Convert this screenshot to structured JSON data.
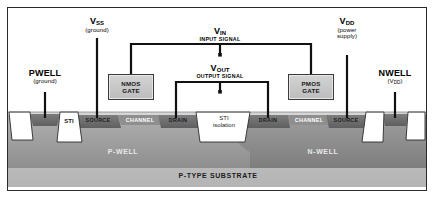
{
  "diagram": {
    "colors": {
      "border": "#2b2b2b",
      "wire": "#111111",
      "gate_fill": "#c8c8c8",
      "sti_fill": "#ffffff",
      "pwell_fill": "#9a9a9a",
      "nwell_fill": "#878787",
      "substrate_fill": "#bfbfbf",
      "diffusion_fill": "#6f6f6f",
      "oxide_fill": "#cfcfcf"
    },
    "top_labels": [
      {
        "id": "pwell-tap",
        "name": "PWELL",
        "sub": "",
        "note": "(ground)"
      },
      {
        "id": "vss",
        "name": "V",
        "sub": "SS",
        "note": "(ground)"
      },
      {
        "id": "vin",
        "name": "V",
        "sub": "IN",
        "note": "INPUT SIGNAL"
      },
      {
        "id": "vout",
        "name": "V",
        "sub": "OUT",
        "note": "OUTPUT SIGNAL"
      },
      {
        "id": "vdd",
        "name": "V",
        "sub": "DD",
        "note": "(power supply)"
      },
      {
        "id": "nwell-tap",
        "name": "NWELL",
        "sub": "",
        "note": "(V"
      }
    ],
    "pwell_label": {
      "name": "PWELL",
      "note": "(ground)"
    },
    "vss_label": {
      "name": "V",
      "sub": "SS",
      "note": "(ground)"
    },
    "vin_label": {
      "name": "V",
      "sub": "IN",
      "note": "INPUT SIGNAL"
    },
    "vout_label": {
      "name": "V",
      "sub": "OUT",
      "note": "OUTPUT SIGNAL"
    },
    "vdd_label": {
      "name": "V",
      "sub": "DD",
      "note_line1": "(power",
      "note_line2": "supply)"
    },
    "nwell_label": {
      "name": "NWELL",
      "note_pre": "(V",
      "note_sub": "DD",
      "note_post": ")"
    },
    "gates": [
      {
        "id": "nmos-gate",
        "line1": "NMOS",
        "line2": "GATE"
      },
      {
        "id": "pmos-gate",
        "line1": "PMOS",
        "line2": "GATE"
      }
    ],
    "sti_left_label": "STI",
    "sti_center_label_line1": "STI",
    "sti_center_label_line2": "isolation",
    "diffusions": [
      {
        "id": "nmos-source",
        "label": "SOURCE"
      },
      {
        "id": "nmos-channel",
        "label": "CHANNEL"
      },
      {
        "id": "nmos-drain",
        "label": "DRAIN"
      },
      {
        "id": "pmos-drain",
        "label": "DRAIN"
      },
      {
        "id": "pmos-channel",
        "label": "CHANNEL"
      },
      {
        "id": "pmos-source",
        "label": "SOURCE"
      }
    ],
    "wells": [
      {
        "id": "p-well",
        "label": "P-WELL"
      },
      {
        "id": "n-well",
        "label": "N-WELL"
      }
    ],
    "substrate_label": "P-TYPE SUBSTRATE"
  }
}
